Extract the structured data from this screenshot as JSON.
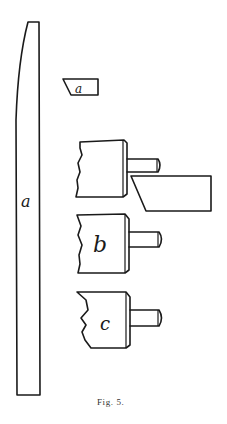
{
  "figure": {
    "caption": "Fig. 5.",
    "labels": {
      "bar": "a",
      "wedge": "a",
      "upper_block": "",
      "middle_block": "b",
      "lower_block": "c"
    },
    "line_color": "#1a1a1a",
    "background": "#ffffff"
  }
}
